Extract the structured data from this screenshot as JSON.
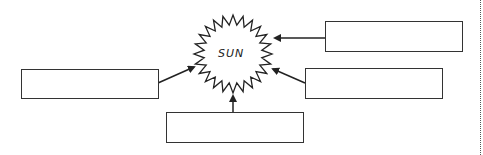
{
  "diagram": {
    "center": {
      "label": "SUN",
      "shape": "sun-starburst"
    },
    "boxes": [
      {
        "id": "top-right",
        "value": "",
        "placeholder": ""
      },
      {
        "id": "middle-right",
        "value": "",
        "placeholder": ""
      },
      {
        "id": "bottom",
        "value": "",
        "placeholder": ""
      },
      {
        "id": "left",
        "value": "",
        "placeholder": ""
      }
    ],
    "arrow_direction": "boxes-to-sun",
    "colors": {
      "stroke": "#333333",
      "background": "#ffffff",
      "dotted_line": "#555555"
    }
  }
}
